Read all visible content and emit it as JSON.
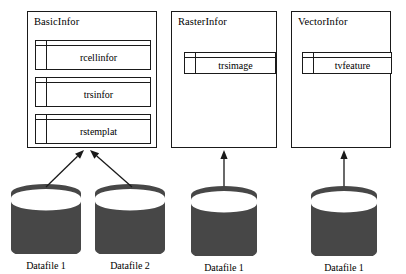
{
  "diagram": {
    "groups": [
      {
        "name": "group-basicinfor",
        "title": "BasicInfor",
        "x": 27,
        "y": 11,
        "w": 130,
        "h": 137,
        "entities": [
          {
            "name": "entity-rcellinfor",
            "label": "rcellinfor",
            "x": 7,
            "y": 28,
            "w": 116,
            "h": 30
          },
          {
            "name": "entity-trsinfor",
            "label": "trsinfor",
            "x": 7,
            "y": 65,
            "w": 116,
            "h": 30
          },
          {
            "name": "entity-rstemplat",
            "label": "rstemplat",
            "x": 7,
            "y": 102,
            "w": 116,
            "h": 30
          }
        ]
      },
      {
        "name": "group-rasterinfor",
        "title": "RasterInfor",
        "x": 171,
        "y": 11,
        "w": 106,
        "h": 137,
        "entities": [
          {
            "name": "entity-trsimage",
            "label": "trsimage",
            "x": 12,
            "y": 40,
            "w": 92,
            "h": 22
          }
        ]
      },
      {
        "name": "group-vectorinfor",
        "title": "VectorInfor",
        "x": 291,
        "y": 11,
        "w": 100,
        "h": 137,
        "entities": [
          {
            "name": "entity-tvfeature",
            "label": "tvfeature",
            "x": 10,
            "y": 40,
            "w": 90,
            "h": 22
          }
        ]
      }
    ],
    "datafiles": [
      {
        "name": "datafile-1-basic",
        "label": "Datafile 1",
        "cx": 46,
        "top": 182,
        "rx": 35,
        "body": 48
      },
      {
        "name": "datafile-2-basic",
        "label": "Datafile 2",
        "cx": 130,
        "top": 182,
        "rx": 35,
        "body": 48
      },
      {
        "name": "datafile-1-raster",
        "label": "Datafile 1",
        "cx": 224,
        "top": 184,
        "rx": 33,
        "body": 48
      },
      {
        "name": "datafile-1-vector",
        "label": "Datafile 1",
        "cx": 344,
        "top": 184,
        "rx": 33,
        "body": 48
      }
    ],
    "arrows": [
      {
        "name": "arrow-datafile1-to-basicinfor",
        "x1": 46,
        "y1": 187,
        "x2": 84,
        "y2": 150
      },
      {
        "name": "arrow-datafile2-to-basicinfor",
        "x1": 132,
        "y1": 187,
        "x2": 90,
        "y2": 150
      },
      {
        "name": "arrow-datafile1-to-rasterinfor",
        "x1": 224,
        "y1": 186,
        "x2": 224,
        "y2": 150
      },
      {
        "name": "arrow-datafile1-to-vectorinfor",
        "x1": 344,
        "y1": 186,
        "x2": 344,
        "y2": 150
      }
    ],
    "colors": {
      "stroke": "#1a1a1a",
      "cylinder_body": "#474747",
      "cylinder_rim": "#ffffff",
      "background": "#ffffff"
    }
  }
}
